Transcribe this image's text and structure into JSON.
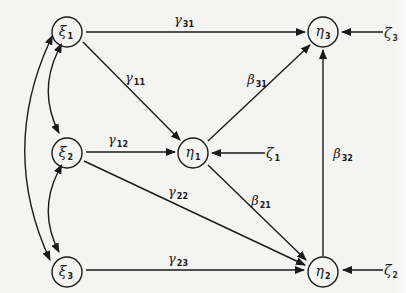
{
  "diagram": {
    "type": "path-diagram",
    "nodes": [
      {
        "id": "xi1",
        "symbol": "ξ",
        "sub": "1",
        "kind": "exogenous",
        "cx": 67,
        "cy": 32
      },
      {
        "id": "xi2",
        "symbol": "ξ",
        "sub": "2",
        "kind": "exogenous",
        "cx": 67,
        "cy": 153
      },
      {
        "id": "xi3",
        "symbol": "ξ",
        "sub": "3",
        "kind": "exogenous",
        "cx": 67,
        "cy": 272
      },
      {
        "id": "eta1",
        "symbol": "η",
        "sub": "1",
        "kind": "endogenous",
        "cx": 193,
        "cy": 153
      },
      {
        "id": "eta3",
        "symbol": "η",
        "sub": "3",
        "kind": "endogenous",
        "cx": 323,
        "cy": 32
      },
      {
        "id": "eta2",
        "symbol": "η",
        "sub": "2",
        "kind": "endogenous",
        "cx": 323,
        "cy": 272
      }
    ],
    "disturbances": [
      {
        "id": "zeta1",
        "symbol": "ζ",
        "sub": "1",
        "target": "eta1"
      },
      {
        "id": "zeta3",
        "symbol": "ζ",
        "sub": "3",
        "target": "eta3"
      },
      {
        "id": "zeta2",
        "symbol": "ζ",
        "sub": "2",
        "target": "eta2"
      }
    ],
    "paths": [
      {
        "from": "xi1",
        "to": "eta3",
        "symbol": "γ",
        "sub": "31"
      },
      {
        "from": "xi1",
        "to": "eta1",
        "symbol": "γ",
        "sub": "11"
      },
      {
        "from": "xi2",
        "to": "eta1",
        "symbol": "γ",
        "sub": "12"
      },
      {
        "from": "xi2",
        "to": "eta2",
        "symbol": "γ",
        "sub": "22"
      },
      {
        "from": "xi3",
        "to": "eta2",
        "symbol": "γ",
        "sub": "23"
      },
      {
        "from": "eta1",
        "to": "eta3",
        "symbol": "β",
        "sub": "31"
      },
      {
        "from": "eta1",
        "to": "eta2",
        "symbol": "β",
        "sub": "21"
      },
      {
        "from": "eta2",
        "to": "eta3",
        "symbol": "β",
        "sub": "32"
      }
    ],
    "covariances": [
      {
        "between": [
          "xi1",
          "xi2"
        ]
      },
      {
        "between": [
          "xi2",
          "xi3"
        ]
      },
      {
        "between": [
          "xi1",
          "xi3"
        ]
      }
    ]
  },
  "labels": {
    "xi1": {
      "sym": "ξ",
      "sub": "1"
    },
    "xi2": {
      "sym": "ξ",
      "sub": "2"
    },
    "xi3": {
      "sym": "ξ",
      "sub": "3"
    },
    "eta1": {
      "sym": "η",
      "sub": "1"
    },
    "eta2": {
      "sym": "η",
      "sub": "2"
    },
    "eta3": {
      "sym": "η",
      "sub": "3"
    },
    "zeta1": {
      "sym": "ζ",
      "sub": "1"
    },
    "zeta2": {
      "sym": "ζ",
      "sub": "2"
    },
    "zeta3": {
      "sym": "ζ",
      "sub": "3"
    },
    "gamma31": {
      "sym": "γ",
      "sub": "31"
    },
    "gamma11": {
      "sym": "γ",
      "sub": "11"
    },
    "gamma12": {
      "sym": "γ",
      "sub": "12"
    },
    "gamma22": {
      "sym": "γ",
      "sub": "22"
    },
    "gamma23": {
      "sym": "γ",
      "sub": "23"
    },
    "beta31": {
      "sym": "β",
      "sub": "31"
    },
    "beta21": {
      "sym": "β",
      "sub": "21"
    },
    "beta32": {
      "sym": "β",
      "sub": "32"
    }
  },
  "colors": {
    "background": "#f4f4f2",
    "ink": "#1a1a1a"
  }
}
